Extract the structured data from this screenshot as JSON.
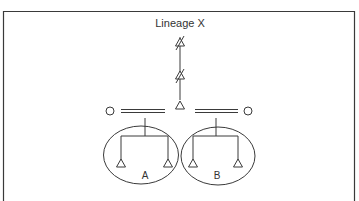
{
  "diagram": {
    "title": "Lineage X",
    "colors": {
      "stroke": "#3a3a3a",
      "text": "#333333",
      "background": "#ffffff"
    },
    "groups": [
      {
        "id": "A",
        "label": "A"
      },
      {
        "id": "B",
        "label": "B"
      }
    ],
    "symbols": {
      "crossed_triangle": "extinct/crossed-out triangle marker",
      "open_triangle": "triangle node",
      "open_circle": "circle node",
      "double_line": "parallel (double) connector"
    }
  }
}
